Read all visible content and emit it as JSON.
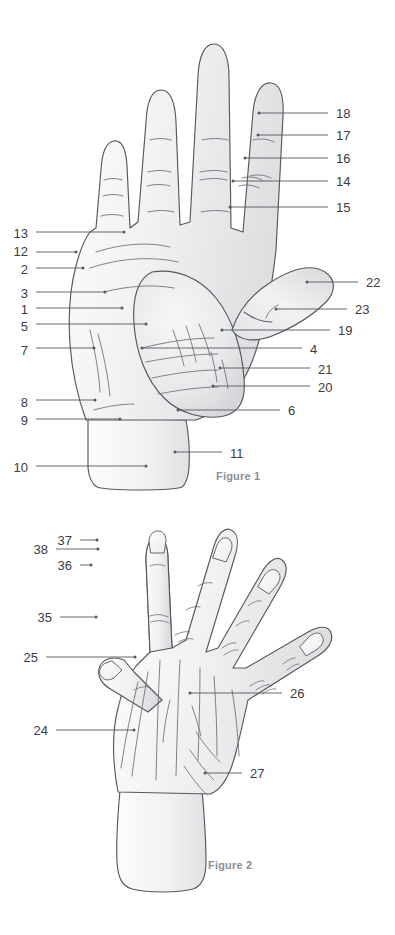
{
  "page": {
    "background": "#ffffff",
    "ink": "#3a3d42",
    "leader_color": "#54575c",
    "outline_color": "#55585e",
    "crease_color": "#6d7076",
    "skin_light": "#fdfdfd",
    "skin_mid": "#ededee",
    "skin_shadow": "#d9dadc",
    "caption_color": "#8d8f93",
    "width": 395,
    "height": 935
  },
  "figures": [
    {
      "id": "figure-1",
      "caption": "Figure 1",
      "view": "palmar",
      "caption_x": 216,
      "caption_y": 470
    },
    {
      "id": "figure-2",
      "caption": "Figure 2",
      "view": "dorsal",
      "caption_x": 208,
      "caption_y": 859
    }
  ],
  "figure1_labels": [
    {
      "number": "13",
      "side": "left",
      "text_x": 28,
      "text_y": 227,
      "line_x1": 36,
      "line_x2": 124,
      "line_y": 232,
      "dot_x": 124,
      "dot_y": 232
    },
    {
      "number": "12",
      "side": "left",
      "text_x": 28,
      "text_y": 245,
      "line_x1": 36,
      "line_x2": 76,
      "line_y": 252,
      "dot_x": 76,
      "dot_y": 252
    },
    {
      "number": "2",
      "side": "left",
      "text_x": 28,
      "text_y": 263,
      "line_x1": 36,
      "line_x2": 83,
      "line_y": 268,
      "dot_x": 83,
      "dot_y": 268
    },
    {
      "number": "3",
      "side": "left",
      "text_x": 28,
      "text_y": 287,
      "line_x1": 36,
      "line_x2": 105,
      "line_y": 292,
      "dot_x": 105,
      "dot_y": 292
    },
    {
      "number": "1",
      "side": "left",
      "text_x": 28,
      "text_y": 303,
      "line_x1": 36,
      "line_x2": 122,
      "line_y": 308,
      "dot_x": 122,
      "dot_y": 308
    },
    {
      "number": "5",
      "side": "left",
      "text_x": 28,
      "text_y": 320,
      "line_x1": 36,
      "line_x2": 146,
      "line_y": 324,
      "dot_x": 146,
      "dot_y": 324
    },
    {
      "number": "7",
      "side": "left",
      "text_x": 28,
      "text_y": 344,
      "line_x1": 36,
      "line_x2": 94,
      "line_y": 348,
      "dot_x": 94,
      "dot_y": 348
    },
    {
      "number": "8",
      "side": "left",
      "text_x": 28,
      "text_y": 396,
      "line_x1": 36,
      "line_x2": 95,
      "line_y": 400,
      "dot_x": 95,
      "dot_y": 400
    },
    {
      "number": "9",
      "side": "left",
      "text_x": 28,
      "text_y": 414,
      "line_x1": 36,
      "line_x2": 120,
      "line_y": 419,
      "dot_x": 120,
      "dot_y": 419
    },
    {
      "number": "10",
      "side": "left",
      "text_x": 28,
      "text_y": 461,
      "line_x1": 36,
      "line_x2": 146,
      "line_y": 466,
      "dot_x": 146,
      "dot_y": 466
    },
    {
      "number": "18",
      "side": "right",
      "text_x": 336,
      "text_y": 107,
      "line_x1": 259,
      "line_x2": 328,
      "line_y": 113,
      "dot_x": 259,
      "dot_y": 113
    },
    {
      "number": "17",
      "side": "right",
      "text_x": 336,
      "text_y": 129,
      "line_x1": 258,
      "line_x2": 328,
      "line_y": 135,
      "dot_x": 258,
      "dot_y": 135
    },
    {
      "number": "16",
      "side": "right",
      "text_x": 336,
      "text_y": 152,
      "line_x1": 245,
      "line_x2": 328,
      "line_y": 158,
      "dot_x": 245,
      "dot_y": 158
    },
    {
      "number": "14",
      "side": "right",
      "text_x": 336,
      "text_y": 175,
      "line_x1": 233,
      "line_x2": 328,
      "line_y": 181,
      "dot_x": 233,
      "dot_y": 181
    },
    {
      "number": "15",
      "side": "right",
      "text_x": 336,
      "text_y": 201,
      "line_x1": 230,
      "line_x2": 328,
      "line_y": 207,
      "dot_x": 230,
      "dot_y": 207
    },
    {
      "number": "22",
      "side": "right",
      "text_x": 366,
      "text_y": 276,
      "line_x1": 307,
      "line_x2": 358,
      "line_y": 282,
      "dot_x": 307,
      "dot_y": 282
    },
    {
      "number": "23",
      "side": "right",
      "text_x": 355,
      "text_y": 303,
      "line_x1": 276,
      "line_x2": 347,
      "line_y": 309,
      "dot_x": 276,
      "dot_y": 309
    },
    {
      "number": "19",
      "side": "right",
      "text_x": 338,
      "text_y": 324,
      "line_x1": 222,
      "line_x2": 330,
      "line_y": 330,
      "dot_x": 222,
      "dot_y": 330
    },
    {
      "number": "4",
      "side": "right",
      "text_x": 310,
      "text_y": 343,
      "line_x1": 142,
      "line_x2": 302,
      "line_y": 348,
      "dot_x": 142,
      "dot_y": 348
    },
    {
      "number": "21",
      "side": "right",
      "text_x": 318,
      "text_y": 363,
      "line_x1": 220,
      "line_x2": 310,
      "line_y": 368,
      "dot_x": 220,
      "dot_y": 368
    },
    {
      "number": "20",
      "side": "right",
      "text_x": 318,
      "text_y": 381,
      "line_x1": 213,
      "line_x2": 310,
      "line_y": 386,
      "dot_x": 213,
      "dot_y": 386
    },
    {
      "number": "6",
      "side": "right",
      "text_x": 288,
      "text_y": 404,
      "line_x1": 178,
      "line_x2": 280,
      "line_y": 410,
      "dot_x": 178,
      "dot_y": 410
    },
    {
      "number": "11",
      "side": "right",
      "text_x": 230,
      "text_y": 447,
      "line_x1": 175,
      "line_x2": 222,
      "line_y": 452,
      "dot_x": 175,
      "dot_y": 452
    }
  ],
  "figure2_labels": [
    {
      "number": "37",
      "side": "left",
      "text_x": 72,
      "text_y": 534,
      "line_x1": 80,
      "line_x2": 97,
      "line_y": 540,
      "dot_x": 97,
      "dot_y": 540
    },
    {
      "number": "38",
      "side": "left",
      "text_x": 48,
      "text_y": 543,
      "line_x1": 56,
      "line_x2": 98,
      "line_y": 549,
      "dot_x": 98,
      "dot_y": 549
    },
    {
      "number": "36",
      "side": "left",
      "text_x": 72,
      "text_y": 559,
      "line_x1": 80,
      "line_x2": 91,
      "line_y": 565,
      "dot_x": 91,
      "dot_y": 565
    },
    {
      "number": "35",
      "side": "left",
      "text_x": 52,
      "text_y": 611,
      "line_x1": 60,
      "line_x2": 96,
      "line_y": 617,
      "dot_x": 96,
      "dot_y": 617
    },
    {
      "number": "25",
      "side": "left",
      "text_x": 38,
      "text_y": 651,
      "line_x1": 46,
      "line_x2": 135,
      "line_y": 657,
      "dot_x": 135,
      "dot_y": 657
    },
    {
      "number": "24",
      "side": "left",
      "text_x": 48,
      "text_y": 724,
      "line_x1": 56,
      "line_x2": 134,
      "line_y": 730,
      "dot_x": 134,
      "dot_y": 730
    },
    {
      "number": "26",
      "side": "right",
      "text_x": 290,
      "text_y": 687,
      "line_x1": 190,
      "line_x2": 282,
      "line_y": 693,
      "dot_x": 190,
      "dot_y": 693
    },
    {
      "number": "27",
      "side": "right",
      "text_x": 250,
      "text_y": 767,
      "line_x1": 205,
      "line_x2": 242,
      "line_y": 773,
      "dot_x": 205,
      "dot_y": 773
    }
  ]
}
